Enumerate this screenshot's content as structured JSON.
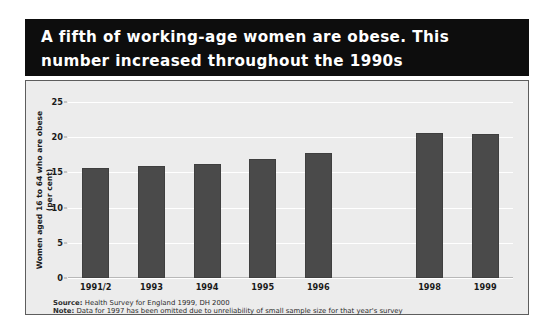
{
  "title": "A fifth of working-age women are obese. This\nnumber increased throughout the 1990s",
  "footnotes": {
    "source_prefix": "Source:",
    "source_text": " Health Survey for England 1999, DH 2000",
    "note_prefix": "Note:",
    "note_text": " Data for 1997 has been omitted due to unreliability of small sample size for that year's survey"
  },
  "colors": {
    "title_band": "#0d0d0d",
    "title_text": "#ffffff",
    "panel_background": "#ececec",
    "panel_border": "#5d5d5d",
    "bar": "#4a4a4a",
    "gridline": "#ffffff",
    "axis_text": "#1a1a1a"
  },
  "chart_data": {
    "type": "bar",
    "title": "A fifth of working-age women are obese. This number increased throughout the 1990s",
    "xlabel": "",
    "ylabel": "Women aged 16 to 64 who are obese (per cent)",
    "categories": [
      "1991/2",
      "1993",
      "1994",
      "1995",
      "1996",
      "",
      "1998",
      "1999"
    ],
    "values": [
      15.6,
      15.9,
      16.2,
      16.9,
      17.8,
      null,
      20.6,
      20.4
    ],
    "ylim": [
      0,
      25
    ],
    "yticks": [
      0,
      5,
      10,
      15,
      20,
      25
    ],
    "ytick_labels": [
      "0",
      "5",
      "10",
      "15",
      "20",
      "25"
    ],
    "grid": true,
    "legend": "none"
  }
}
